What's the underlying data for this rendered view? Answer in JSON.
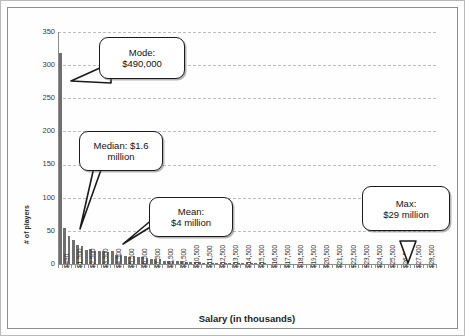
{
  "chart_data": {
    "type": "bar",
    "title": "",
    "xlabel": "Salary (in thousands)",
    "ylabel": "# of players",
    "ylim": [
      0,
      350
    ],
    "ytick_labels": [
      "0",
      "50",
      "100",
      "150",
      "200",
      "250",
      "300",
      "350"
    ],
    "ytick_values": [
      0,
      50,
      100,
      150,
      200,
      250,
      300,
      350
    ],
    "grid": true,
    "legend": "none",
    "categories": [
      "$490",
      "$1,500",
      "$2,500",
      "$3,500",
      "$4,500",
      "$5,500",
      "$6,500",
      "$7,500",
      "$8,500",
      "$9,500",
      "$10,500",
      "$11,500",
      "$12,500",
      "$13,500",
      "$14,500",
      "$15,500",
      "$16,500",
      "$17,500",
      "$18,500",
      "$19,500",
      "$20,500",
      "$21,500",
      "$22,500",
      "$23,500",
      "$24,500",
      "$25,500",
      "$26,500",
      "$27,500",
      "$28,500"
    ],
    "bin_values": [
      318,
      55,
      43,
      36,
      29,
      27,
      21,
      22,
      19,
      20,
      20,
      18,
      19,
      14,
      13,
      12,
      11,
      12,
      11,
      10,
      9,
      8,
      8,
      7,
      5,
      5,
      4,
      4,
      4,
      3,
      3,
      3,
      3,
      2,
      2,
      2,
      2,
      2,
      1,
      1,
      1,
      1,
      1,
      1,
      1,
      1,
      1,
      1,
      0,
      0,
      0,
      0,
      0,
      0,
      0,
      0,
      0,
      0,
      0,
      0,
      0,
      0,
      0,
      0,
      0,
      0,
      0,
      0,
      0,
      0,
      0,
      0,
      0,
      0,
      0,
      0,
      0,
      0,
      0,
      0,
      0,
      0,
      0,
      0,
      0,
      0,
      0
    ],
    "annotations": [
      {
        "name": "mode",
        "line1": "Mode:",
        "line2": "$490,000",
        "value": "$490,000"
      },
      {
        "name": "median",
        "line1": "Median: $1.6",
        "line2": "million",
        "value": "$1.6 million"
      },
      {
        "name": "mean",
        "line1": "Mean:",
        "line2": "$4 million",
        "value": "$4 million"
      },
      {
        "name": "max",
        "line1": "Max:",
        "line2": "$29 million",
        "value": "$29 million"
      }
    ],
    "colors": {
      "bar": "#6f6f6f",
      "grid": "#bdbdbd",
      "axis": "#8a8a8a",
      "callout_border": "#1b1b1b",
      "background": "#ffffff"
    }
  }
}
